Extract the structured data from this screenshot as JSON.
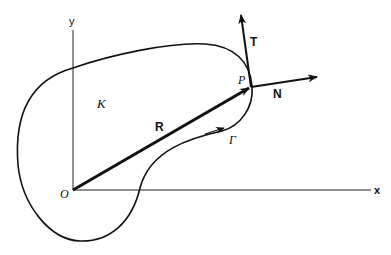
{
  "diagram": {
    "type": "geometry-vector-diagram",
    "axes": {
      "x_label": "x",
      "y_label": "y",
      "origin_label": "O"
    },
    "region_label": "K",
    "curve_label": "Γ",
    "point_label": "P",
    "vectors": [
      {
        "name": "R",
        "label": "R",
        "from": "O",
        "to": "P",
        "description": "position vector"
      },
      {
        "name": "T",
        "label": "T",
        "from": "P",
        "description": "tangent vector"
      },
      {
        "name": "N",
        "label": "N",
        "from": "P",
        "description": "outward normal vector"
      }
    ],
    "colors": {
      "stroke": "#111111",
      "background": "#ffffff"
    }
  }
}
